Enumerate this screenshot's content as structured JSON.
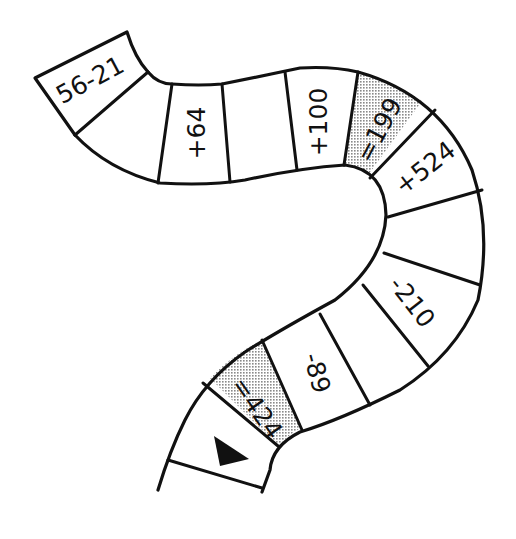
{
  "colors": {
    "ink": "#111111",
    "shade": "#c8c8c8",
    "background": "#ffffff"
  },
  "cells": [
    {
      "id": "start-cell",
      "label": "56-21",
      "shaded": false
    },
    {
      "id": "blank-1",
      "label": "",
      "shaded": false
    },
    {
      "id": "plus-64",
      "label": "+64",
      "shaded": false
    },
    {
      "id": "blank-2",
      "label": "",
      "shaded": false
    },
    {
      "id": "plus-100",
      "label": "+100",
      "shaded": false
    },
    {
      "id": "equals-199",
      "label": "=199",
      "shaded": true
    },
    {
      "id": "plus-524",
      "label": "+524",
      "shaded": false
    },
    {
      "id": "blank-3",
      "label": "",
      "shaded": false
    },
    {
      "id": "minus-210",
      "label": "-210",
      "shaded": false
    },
    {
      "id": "blank-4",
      "label": "",
      "shaded": false
    },
    {
      "id": "minus-89",
      "label": "-89",
      "shaded": false
    },
    {
      "id": "equals-424",
      "label": "=424",
      "shaded": true
    },
    {
      "id": "end-cell",
      "label": "",
      "icon": "arrow-triangle-icon",
      "shaded": false
    }
  ]
}
